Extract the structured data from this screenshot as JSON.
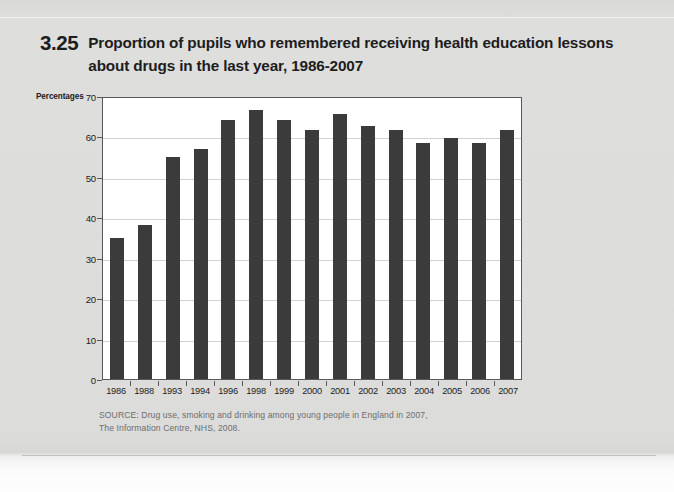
{
  "figure": {
    "number": "3.25",
    "title": "Proportion of pupils who remembered receiving health education lessons about drugs in the last year, 1986-2007"
  },
  "source": {
    "line1": "SOURCE: Drug use, smoking and drinking among young people in England in 2007,",
    "line2": "The Information Centre, NHS, 2008."
  },
  "colors": {
    "bar": "#3b3b3b",
    "page_background": "#dcdcdb",
    "plot_background": "#ffffff",
    "frame": "#58585a",
    "gridline": "#d2d2d2",
    "source_text": "#6d6d6d"
  },
  "chart_data": {
    "type": "bar",
    "title": "Proportion of pupils who remembered receiving health education lessons about drugs in the last year, 1986-2007",
    "xlabel": "",
    "ylabel": "Percentages",
    "ylim": [
      0,
      70
    ],
    "yticks": [
      0,
      10,
      20,
      30,
      40,
      50,
      60,
      70
    ],
    "ytick_labels": [
      "0",
      "10",
      "20",
      "30",
      "40",
      "50",
      "60",
      "70"
    ],
    "grid": true,
    "legend": false,
    "categories": [
      "1986",
      "1988",
      "1993",
      "1994",
      "1996",
      "1998",
      "1999",
      "2000",
      "2001",
      "2002",
      "2003",
      "2004",
      "2005",
      "2006",
      "2007"
    ],
    "values": [
      35,
      38,
      55,
      57,
      64,
      66.5,
      64,
      61.5,
      65.5,
      62.5,
      61.5,
      58.5,
      59.5,
      58.5,
      61.5
    ]
  }
}
